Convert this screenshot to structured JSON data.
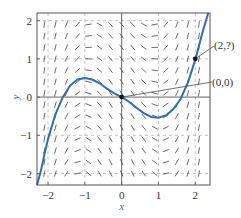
{
  "chart_data": {
    "type": "line",
    "subtype": "slope-field-with-solution-curve",
    "title": "",
    "xlabel": "x",
    "ylabel": "y",
    "xlim": [
      -2.3,
      2.4
    ],
    "ylim": [
      -2.3,
      2.2
    ],
    "xticks": [
      -2,
      -1,
      0,
      1,
      2
    ],
    "yticks": [
      -2,
      -1,
      0,
      1,
      2
    ],
    "xtick_labels": [
      "−2",
      "−1",
      "0",
      "1",
      "2"
    ],
    "ytick_labels": [
      "−2",
      "−1",
      "0",
      "1",
      "2"
    ],
    "grid": true,
    "grid_style": "dashed",
    "slope_field": {
      "x_values": [
        -2.1,
        -1.8,
        -1.5,
        -1.2,
        -0.9,
        -0.6,
        -0.3,
        0.0,
        0.3,
        0.6,
        0.9,
        1.2,
        1.5,
        1.8,
        2.1
      ],
      "y_values": [
        -2.0,
        -1.7,
        -1.4,
        -1.1,
        -0.8,
        -0.5,
        -0.2,
        0.1,
        0.4,
        0.7,
        1.0,
        1.3,
        1.6,
        1.9
      ],
      "description": "short line segments showing slope at each grid point; steep near |x|=2, near-horizontal/negative near x in (-1,1) and y near 0"
    },
    "series": [
      {
        "name": "solution curve",
        "color": "#2f6db5",
        "x": [
          -2.3,
          -2.2,
          -2.1,
          -2.0,
          -1.8,
          -1.6,
          -1.4,
          -1.2,
          -1.0,
          -0.8,
          -0.6,
          -0.4,
          -0.2,
          0.0,
          0.2,
          0.4,
          0.6,
          0.8,
          1.0,
          1.2,
          1.4,
          1.6,
          1.8,
          2.0,
          2.2,
          2.35
        ],
        "y": [
          -2.3,
          -1.95,
          -1.5,
          -1.1,
          -0.45,
          0.0,
          0.3,
          0.46,
          0.5,
          0.46,
          0.36,
          0.22,
          0.1,
          0.0,
          -0.12,
          -0.28,
          -0.42,
          -0.52,
          -0.54,
          -0.48,
          -0.32,
          -0.05,
          0.38,
          0.98,
          1.7,
          2.2
        ]
      }
    ],
    "points": [
      {
        "x": 0,
        "y": 0,
        "label": "(0,0)"
      },
      {
        "x": 2,
        "y": 1,
        "label": "(2,?)"
      }
    ],
    "annotations": [
      {
        "text": "(2,?)",
        "points_to": [
          2,
          1
        ]
      },
      {
        "text": "(0,0)",
        "points_to": [
          0,
          0
        ]
      }
    ]
  },
  "colors": {
    "curve": "#2f6db5",
    "field": "#444444",
    "frame": "#555555",
    "grid": "#9a9a9a"
  }
}
